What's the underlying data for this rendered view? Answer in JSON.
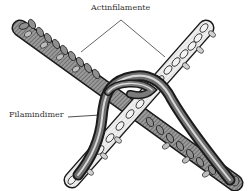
{
  "diagram": {
    "labels": {
      "actin_filaments": "Actinfilamente",
      "filamin_dimer": "Filamindimer"
    },
    "colors": {
      "filament_outline": "#1a1a1a",
      "filament_dark_fill": "#8a8a8a",
      "filament_light_fill": "#e6e6e6",
      "dimer_dark": "#1a1a1a",
      "dimer_mid": "#6e6e6e",
      "dimer_highlight": "#d8d8d8",
      "leader_line": "#222222",
      "background": "#ffffff"
    },
    "elements": [
      {
        "id": "actin-filament-left",
        "description": "beaded helical filament from upper-left to lower-right"
      },
      {
        "id": "actin-filament-right",
        "description": "beaded helical filament from upper-right to lower-left"
      },
      {
        "id": "filamin-dimer",
        "description": "V-shaped tubular dimer looping over the filament crossing"
      }
    ]
  }
}
